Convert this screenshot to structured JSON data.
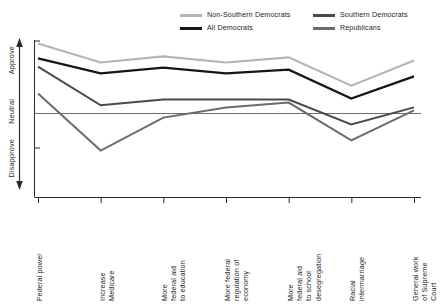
{
  "legend": {
    "position": "top",
    "items": [
      {
        "label": "Non-Southern Democrats",
        "color": "#b4b4b4"
      },
      {
        "label": "All Democrats",
        "color": "#161616"
      },
      {
        "label": "Southern Democrats",
        "color": "#4a4a4a"
      },
      {
        "label": "Republicans",
        "color": "#6b6b6b"
      }
    ]
  },
  "yaxis": {
    "top_label": "Approve",
    "mid_label": "Neutral",
    "bottom_label": "Disapprove"
  },
  "chart_data": {
    "type": "line",
    "title": "",
    "subtitle": "",
    "xlabel": "",
    "ylabel": "Approve / Neutral / Disapprove",
    "grid": false,
    "legend_position": "top",
    "reference_line": {
      "value": 0,
      "label": "Neutral"
    },
    "ylim": [
      -2,
      2
    ],
    "ytick_labels": [
      "Approve",
      "Neutral",
      "Disapprove"
    ],
    "ytick_values": [
      2,
      0,
      -2
    ],
    "categories": [
      "Federal power",
      "Increase\nMedicare",
      "More\nfederal aid\nto education",
      "More federal\nregulation of\neconomy",
      "More\nfederal aid\nto school\ndesegregation",
      "Racial\nintermarriage",
      "General work\nof Supreme\nCourt"
    ],
    "series": [
      {
        "name": "Non-Southern Democrats",
        "color": "#b4b4b4",
        "width": 2.1,
        "values": [
          2.06,
          1.5,
          1.68,
          1.5,
          1.65,
          0.82,
          1.56
        ]
      },
      {
        "name": "All Democrats",
        "color": "#161616",
        "width": 2.3,
        "values": [
          1.62,
          1.18,
          1.35,
          1.18,
          1.29,
          0.44,
          1.09
        ]
      },
      {
        "name": "Southern Democrats",
        "color": "#4a4a4a",
        "width": 2.0,
        "values": [
          1.38,
          0.24,
          0.41,
          0.41,
          0.41,
          -0.32,
          0.18
        ]
      },
      {
        "name": "Republicans",
        "color": "#6b6b6b",
        "width": 2.0,
        "values": [
          0.59,
          -1.09,
          -0.12,
          0.18,
          0.32,
          -0.79,
          0.09
        ]
      }
    ]
  }
}
